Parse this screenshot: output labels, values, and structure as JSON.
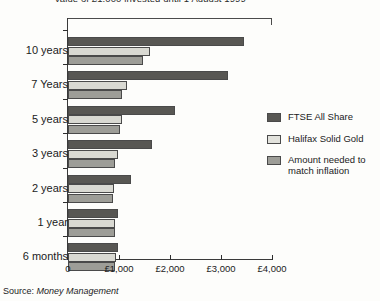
{
  "chart_data": {
    "type": "bar",
    "orientation": "horizontal",
    "title": "Value of £1,000 invested until 1 August 1999",
    "xlabel": "",
    "ylabel": "",
    "xlim": [
      0,
      4000
    ],
    "grid": false,
    "legend_position": "right",
    "categories": [
      "10 years",
      "7 Years",
      "5 years",
      "3 years",
      "2 years",
      "1 year",
      "6 months"
    ],
    "tick_values": [
      0,
      1000,
      2000,
      3000,
      4000
    ],
    "tick_labels": [
      "0",
      "£1,000",
      "£2,000",
      "£3,000",
      "£4,000"
    ],
    "series": [
      {
        "name": "FTSE All Share",
        "color": "#585753",
        "values": [
          3450,
          3130,
          2100,
          1650,
          1240,
          990,
          980
        ]
      },
      {
        "name": "Halifax Solid Gold",
        "color": "#d9d9d2",
        "values": [
          1610,
          1160,
          1060,
          990,
          900,
          930,
          940
        ]
      },
      {
        "name": "Amount needed to match inflation",
        "color": "#9d9d97",
        "values": [
          1470,
          1060,
          1020,
          930,
          880,
          920,
          930
        ]
      }
    ]
  },
  "source": {
    "prefix": "Source:",
    "name": "Money Management"
  }
}
